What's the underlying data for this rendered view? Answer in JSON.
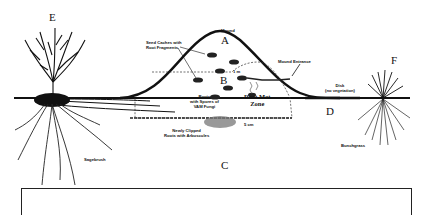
{
  "figure": {
    "type": "cross-section diagram",
    "region_labels": [
      {
        "id": "A",
        "text": "A"
      },
      {
        "id": "B",
        "text": "B"
      },
      {
        "id": "C",
        "text": "C"
      },
      {
        "id": "D",
        "text": "D"
      },
      {
        "id": "E",
        "text": "E"
      },
      {
        "id": "F",
        "text": "F"
      }
    ],
    "annotations": {
      "mound_top": "Mound",
      "seed_caches": "Seed Caches with\nRoot Fragments",
      "mound_entrance": "Mound Entrance",
      "disk": "Disk\n(no vegetation)",
      "one_m": "1 m",
      "roots_ant_fungi": "Roots\nwith Spores of\nVAM Fungi",
      "root_mat_zone": "Root Mat\nZone",
      "five_cm": "5 cm",
      "dead_roots": "Newly Clipped\nRoots with Arbuscules",
      "sagebrush": "Sagebrush",
      "bunchgrass": "Bunchgrass"
    },
    "caption_box": {
      "text": ""
    },
    "colors": {
      "ink": "#111111",
      "paper": "#ffffff"
    }
  }
}
